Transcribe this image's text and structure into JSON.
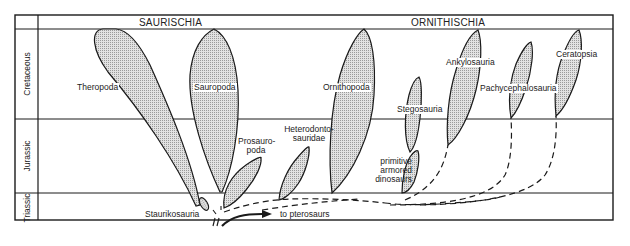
{
  "header": {
    "saurischia": "SAURISCHIA",
    "ornithischia": "ORNITHISCHIA"
  },
  "periods": [
    {
      "name": "Cretaceous"
    },
    {
      "name": "Jurassic"
    },
    {
      "name": "Triassic"
    }
  ],
  "groups": {
    "theropoda": "Theropoda",
    "sauropoda": "Sauropoda",
    "prosauropoda_1": "Prosauro-",
    "prosauropoda_2": "poda",
    "staurikosauria": "Staurikosauria",
    "heterodontosauridae_1": "Heterodonto-",
    "heterodontosauridae_2": "sauridae",
    "ornithopoda": "Ornithopoda",
    "stegosauria": "Stegosauria",
    "primitive_armored_1": "primitive",
    "primitive_armored_2": "armored",
    "primitive_armored_3": "dinosaurs",
    "ankylosauria": "Ankylosauria",
    "pachycephalosauria": "Pachycephalosauria",
    "ceratopsia": "Ceratopsia"
  },
  "annotations": {
    "pterosaurs": "to pterosaurs"
  },
  "colors": {
    "line": "#1a1a1a",
    "fill": "#cfcfcf",
    "background": "#ffffff"
  }
}
